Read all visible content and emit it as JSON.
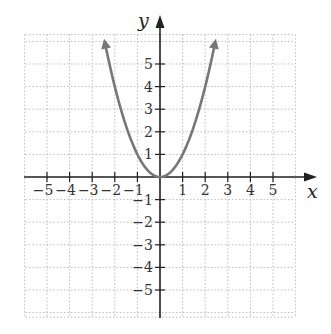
{
  "chart_data": {
    "type": "line",
    "title": "",
    "xlabel": "x",
    "ylabel": "y",
    "xlim": [
      -6,
      6
    ],
    "ylim": [
      -6,
      6
    ],
    "grid": true,
    "grid_style": "dotted",
    "x_ticks": [
      -5,
      -4,
      -3,
      -2,
      -1,
      1,
      2,
      3,
      4,
      5
    ],
    "y_ticks": [
      -5,
      -4,
      -3,
      -2,
      -1,
      1,
      2,
      3,
      4,
      5
    ],
    "x_tick_labels": [
      "−5",
      "−4",
      "−3",
      "−2",
      "−1",
      "1",
      "2",
      "3",
      "4",
      "5"
    ],
    "y_tick_labels": [
      "−5",
      "−4",
      "−3",
      "−2",
      "−1",
      "1",
      "2",
      "3",
      "4",
      "5"
    ],
    "series": [
      {
        "name": "y = x^2",
        "color": "#777777",
        "arrows": "both-ends",
        "x": [
          -2.45,
          -2,
          -1.5,
          -1,
          -0.5,
          0,
          0.5,
          1,
          1.5,
          2,
          2.45
        ],
        "y": [
          6,
          4,
          2.25,
          1,
          0.25,
          0,
          0.25,
          1,
          2.25,
          4,
          6
        ]
      }
    ],
    "legend": null
  },
  "colors": {
    "axis": "#222222",
    "grid": "#bbbbbb",
    "curve": "#777777",
    "background": "#ffffff"
  }
}
